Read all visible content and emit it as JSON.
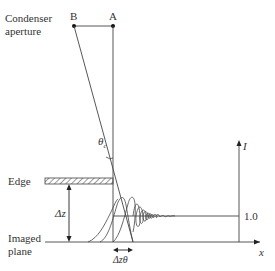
{
  "labels": {
    "condenser": "Condenser",
    "aperture": "aperture",
    "point_b": "B",
    "point_a": "A",
    "theta_c": "θ",
    "theta_sub": "c",
    "edge": "Edge",
    "delta_z": "Δz",
    "imaged": "Imaged",
    "plane": "plane",
    "delta_z_theta": "Δzθ",
    "axis_i": "I",
    "axis_x": "x",
    "level": "1.0"
  },
  "colors": {
    "line": "#333333",
    "hatch": "#555555"
  }
}
